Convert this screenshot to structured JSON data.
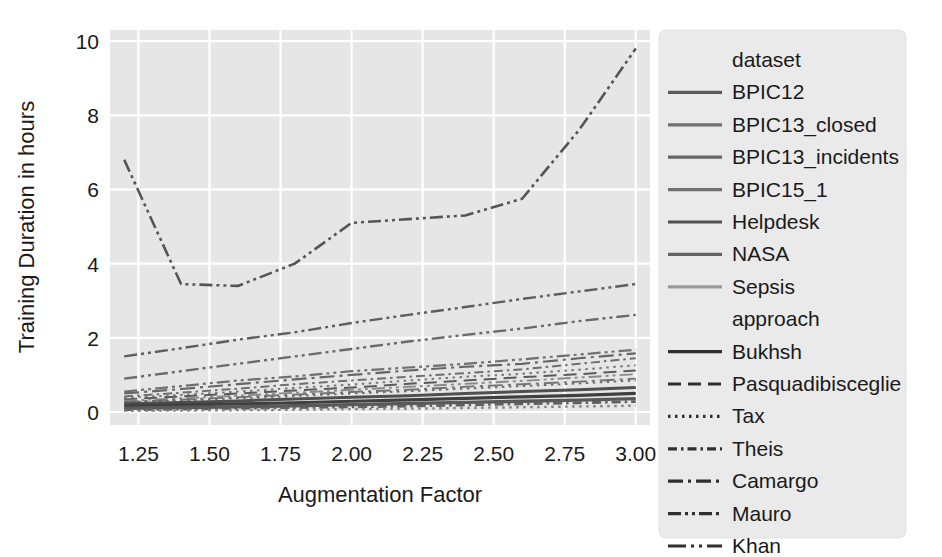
{
  "chart_data": {
    "type": "line",
    "title": "",
    "xlabel": "Augmentation Factor",
    "ylabel": "Training Duration in hours",
    "xlim": [
      1.15,
      3.05
    ],
    "ylim": [
      -0.35,
      10.3
    ],
    "xticks": [
      "1.25",
      "1.50",
      "1.75",
      "2.00",
      "2.25",
      "2.50",
      "2.75",
      "3.00"
    ],
    "xtick_values": [
      1.25,
      1.5,
      1.75,
      2.0,
      2.25,
      2.5,
      2.75,
      3.0
    ],
    "yticks": [
      "0",
      "2",
      "4",
      "6",
      "8",
      "10"
    ],
    "ytick_values": [
      0,
      2,
      4,
      6,
      8,
      10
    ],
    "grid": true,
    "grid_color": "#ffffff",
    "plot_background": "#e6e6e6",
    "legend_position": "right-outside",
    "x": [
      1.2,
      1.4,
      1.6,
      1.8,
      2.0,
      2.2,
      2.4,
      2.6,
      2.8,
      3.0
    ],
    "series": [
      {
        "name": "BPIC15_1 / Khan",
        "dataset": "BPIC15_1",
        "approach": "Khan",
        "dash": "dashdotdot",
        "color": "#555555",
        "width": 2.6,
        "values": [
          6.8,
          3.45,
          3.4,
          4.0,
          5.1,
          5.2,
          5.3,
          5.75,
          7.6,
          9.8
        ]
      },
      {
        "name": "BPIC12 / Khan",
        "dataset": "BPIC12",
        "approach": "Khan",
        "dash": "dashdotdot",
        "color": "#5e5e5e",
        "width": 2.4,
        "values": [
          1.5,
          1.72,
          1.95,
          2.15,
          2.4,
          2.62,
          2.83,
          3.05,
          3.25,
          3.45
        ]
      },
      {
        "name": "BPIC13_incidents / Khan",
        "dataset": "BPIC13_incidents",
        "approach": "Khan",
        "dash": "dashdotdot",
        "color": "#6a6a6a",
        "width": 2.4,
        "values": [
          0.9,
          1.1,
          1.3,
          1.5,
          1.7,
          1.9,
          2.08,
          2.25,
          2.45,
          2.62
        ]
      },
      {
        "name": "BPIC12 / Mauro",
        "dataset": "BPIC12",
        "approach": "Mauro",
        "dash": "dashdotdot",
        "color": "#707070",
        "width": 2.2,
        "values": [
          0.55,
          0.7,
          0.85,
          0.96,
          1.1,
          1.2,
          1.3,
          1.42,
          1.55,
          1.68
        ]
      },
      {
        "name": "BPIC12 / Camargo",
        "dataset": "BPIC12",
        "approach": "Camargo",
        "dash": "dashdot",
        "color": "#666666",
        "width": 2.2,
        "values": [
          0.5,
          0.62,
          0.75,
          0.88,
          1.0,
          1.12,
          1.22,
          1.3,
          1.45,
          1.58
        ]
      },
      {
        "name": "BPIC13_closed / Theis",
        "dataset": "BPIC13_closed",
        "approach": "Theis",
        "dash": "dashdotsmall",
        "color": "#6e6e6e",
        "width": 2.0,
        "values": [
          0.42,
          0.52,
          0.63,
          0.75,
          0.85,
          0.95,
          1.05,
          1.15,
          1.3,
          1.45
        ]
      },
      {
        "name": "Helpdesk / Tax",
        "dataset": "Helpdesk",
        "approach": "Tax",
        "dash": "dotted",
        "color": "#777777",
        "width": 2.0,
        "values": [
          0.38,
          0.46,
          0.55,
          0.65,
          0.74,
          0.85,
          0.95,
          1.03,
          1.14,
          1.26
        ]
      },
      {
        "name": "NASA / Pasquadibisceglie",
        "dataset": "NASA",
        "approach": "Pasquadibisceglie",
        "dash": "dashed",
        "color": "#5a5a5a",
        "width": 2.0,
        "values": [
          0.34,
          0.42,
          0.5,
          0.58,
          0.66,
          0.76,
          0.85,
          0.94,
          1.02,
          1.12
        ]
      },
      {
        "name": "Sepsis / Mauro",
        "dataset": "Sepsis",
        "approach": "Mauro",
        "dash": "dashdotdot",
        "color": "#8a8a8a",
        "width": 1.9,
        "values": [
          0.3,
          0.37,
          0.44,
          0.52,
          0.6,
          0.68,
          0.76,
          0.84,
          0.93,
          1.02
        ]
      },
      {
        "name": "BPIC13_closed / Camargo",
        "dataset": "BPIC13_closed",
        "approach": "Camargo",
        "dash": "dashdot",
        "color": "#747474",
        "width": 1.9,
        "values": [
          0.28,
          0.33,
          0.4,
          0.47,
          0.54,
          0.6,
          0.68,
          0.75,
          0.82,
          0.9
        ]
      },
      {
        "name": "BPIC13_incidents / Tax",
        "dataset": "BPIC13_incidents",
        "approach": "Tax",
        "dash": "dotted",
        "color": "#6b6b6b",
        "width": 1.9,
        "values": [
          0.26,
          0.31,
          0.37,
          0.43,
          0.5,
          0.56,
          0.63,
          0.7,
          0.77,
          0.85
        ]
      },
      {
        "name": "Helpdesk / Bukhsh",
        "dataset": "Helpdesk",
        "approach": "Bukhsh",
        "dash": "solid",
        "color": "#4f4f4f",
        "width": 3.0,
        "values": [
          0.22,
          0.26,
          0.3,
          0.35,
          0.4,
          0.44,
          0.5,
          0.55,
          0.6,
          0.66
        ]
      },
      {
        "name": "NASA / Bukhsh",
        "dataset": "NASA",
        "approach": "Bukhsh",
        "dash": "solid",
        "color": "#3f3f3f",
        "width": 3.2,
        "values": [
          0.16,
          0.19,
          0.22,
          0.25,
          0.29,
          0.33,
          0.37,
          0.41,
          0.45,
          0.5
        ]
      },
      {
        "name": "Sepsis / Bukhsh",
        "dataset": "Sepsis",
        "approach": "Bukhsh",
        "dash": "solid",
        "color": "#595959",
        "width": 3.4,
        "values": [
          0.1,
          0.12,
          0.14,
          0.17,
          0.2,
          0.23,
          0.26,
          0.29,
          0.32,
          0.36
        ]
      },
      {
        "name": "BPIC13_closed / Theis lower",
        "dataset": "BPIC13_closed",
        "approach": "Theis",
        "dash": "dashdotsmall",
        "color": "#606060",
        "width": 2.8,
        "values": [
          0.06,
          0.08,
          0.1,
          0.12,
          0.14,
          0.16,
          0.19,
          0.22,
          0.25,
          0.28
        ]
      },
      {
        "name": "Sepsis / Tax lower",
        "dataset": "Sepsis",
        "approach": "Tax",
        "dash": "dotted",
        "color": "#828282",
        "width": 2.4,
        "values": [
          0.03,
          0.04,
          0.05,
          0.06,
          0.08,
          0.09,
          0.11,
          0.13,
          0.15,
          0.17
        ]
      }
    ]
  },
  "legend": {
    "groups": [
      {
        "title": "dataset",
        "entries": [
          {
            "label": "BPIC12",
            "dash": "solid",
            "color": "#5b5b5b"
          },
          {
            "label": "BPIC13_closed",
            "dash": "solid",
            "color": "#6f6f6f"
          },
          {
            "label": "BPIC13_incidents",
            "dash": "solid",
            "color": "#666666"
          },
          {
            "label": "BPIC15_1",
            "dash": "solid",
            "color": "#717171"
          },
          {
            "label": "Helpdesk",
            "dash": "solid",
            "color": "#505050"
          },
          {
            "label": "NASA",
            "dash": "solid",
            "color": "#636363"
          },
          {
            "label": "Sepsis",
            "dash": "solid",
            "color": "#9a9a9a"
          }
        ]
      },
      {
        "title": "approach",
        "entries": [
          {
            "label": "Bukhsh",
            "dash": "solid",
            "color": "#2f2f2f"
          },
          {
            "label": "Pasquadibisceglie",
            "dash": "dashed",
            "color": "#2f2f2f"
          },
          {
            "label": "Tax",
            "dash": "dotted",
            "color": "#2f2f2f"
          },
          {
            "label": "Theis",
            "dash": "dashdotsmall",
            "color": "#2f2f2f"
          },
          {
            "label": "Camargo",
            "dash": "dashdot",
            "color": "#2f2f2f"
          },
          {
            "label": "Mauro",
            "dash": "dashdotdot",
            "color": "#2f2f2f"
          },
          {
            "label": "Khan",
            "dash": "dashdotdotlong",
            "color": "#2f2f2f"
          }
        ]
      }
    ]
  }
}
